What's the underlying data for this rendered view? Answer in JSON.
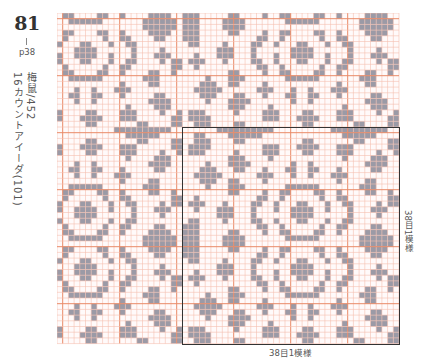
{
  "header": {
    "pattern_number": "81",
    "page": "p38",
    "thread": "梅鼠/452",
    "fabric": "16カウントアイーダ(101)"
  },
  "labels": {
    "repeat_width": "38目1模様",
    "repeat_height": "38目1模様"
  },
  "grid": {
    "cols": 60,
    "rows": 58,
    "cell_px": 5.7,
    "thick_every": 10,
    "thick_offset_col": 1,
    "thick_offset_row": 1,
    "repeat_size": 38,
    "repeat_origin_col": 22,
    "repeat_origin_row": 20,
    "colors": {
      "fill": "#9b9aa6",
      "thin_line": "#f5bfb0",
      "thick_line": "#e98a68",
      "background": "#fffafa",
      "box": "#333333"
    }
  },
  "repeat_rows": [
    "......##########..........##########..",
    "..##....######..............######....",
    "..###....##..........##.......##....##",
    ".####.........###...####...###......##",
    ".###.....#....###....##....###....#..#",
    "........###....#............#....###..",
    "....#...####.......#..#.........####..",
    "...###...##...#...##..##...#.....##...",
    "..#####......###...#..#...###.........",
    "...###..##....#............#....##....",
    "....#...###.......######.......###....",
    "........##....#..##....##..#....##..#.",
    "..#..........##..#......#..##.......##",
    ".###...#....##..#...##...#..##....#.##",
    "..#...###...#...#..####..#...#...###..",
    "......###...#......####......#....#...",
    ".##....#....##..#...##...#..##........",
    "###..........##..#......#..##....##...",
    "###.....##....#..##....##..#....####..",
    "###....####.......######.......######.",
    "###....####....................######.",
    "###.....##....#..##....##..#....####..",
    "###..........##..#......#..##....##...",
    ".##....#....##..#...##...#..##........",
    "......###...#......####......#....#...",
    "..#...###...#...#..####..#...#...###..",
    ".###...#....##..#...##...#..##....#.##",
    "..#..........##..#......#..##.......##",
    "........##....#..##....##..#....##..#.",
    "....#...###.......######.......###....",
    "...###..##....#............#....##....",
    "..#####......###...#..#...###.........",
    "...###...##...#...##..##...#.....##...",
    "....#...####.......#..#.........####..",
    "........###....#............#....###..",
    ".###.....#....###....##....###....#..#",
    ".####.........###...####...###......##",
    "..###....##..........##.......##....##"
  ]
}
